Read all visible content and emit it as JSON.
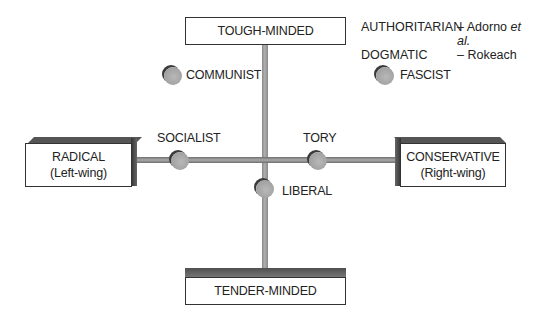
{
  "diagram": {
    "vertical_axis": {
      "top_label": "TOUGH-MINDED",
      "bottom_label": "TENDER-MINDED"
    },
    "horizontal_axis": {
      "left_label_line1": "RADICAL",
      "left_label_line2": "(Left-wing)",
      "right_label_line1": "CONSERVATIVE",
      "right_label_line2": "(Right-wing)"
    },
    "nodes": [
      {
        "label": "COMMUNIST",
        "quadrant": "tough-minded radical"
      },
      {
        "label": "FASCIST",
        "quadrant": "tough-minded conservative"
      },
      {
        "label": "SOCIALIST",
        "position": "radical axis"
      },
      {
        "label": "TORY",
        "position": "conservative axis"
      },
      {
        "label": "LIBERAL",
        "position": "tender-minded centre"
      }
    ],
    "legend": [
      {
        "term": "AUTHORITARIAN",
        "source_prefix": "– Adorno ",
        "source_italic": "et al."
      },
      {
        "term": "DOGMATIC",
        "source_prefix": "– Rokeach",
        "source_italic": ""
      }
    ],
    "colors": {
      "node_fill": "#a8a8a8",
      "node_shadow": "#3a3a3a",
      "bar": "#9a9a9a",
      "box_border": "#333333",
      "box_shade": "#555555"
    }
  }
}
